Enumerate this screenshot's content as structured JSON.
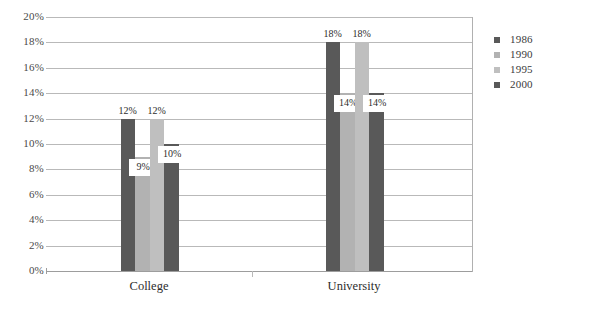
{
  "chart_data": {
    "type": "bar",
    "title": "",
    "subtitle": "",
    "xlabel": "",
    "ylabel": "",
    "categories": [
      "College",
      "University"
    ],
    "series": [
      {
        "name": "1986",
        "values": [
          12,
          18
        ],
        "color": "#595959"
      },
      {
        "name": "1990",
        "values": [
          9,
          14
        ],
        "color": "#b2b2b2"
      },
      {
        "name": "1995",
        "values": [
          12,
          18
        ],
        "color": "#bfbfbf"
      },
      {
        "name": "2000",
        "values": [
          10,
          14
        ],
        "color": "#595959"
      }
    ],
    "value_labels": [
      [
        "12%",
        "9%",
        "12%",
        "10%"
      ],
      [
        "18%",
        "14%",
        "18%",
        "14%"
      ]
    ],
    "ylim": [
      0,
      20
    ],
    "ytick_step": 2,
    "ytick_labels": [
      "20%",
      "18%",
      "16%",
      "14%",
      "12%",
      "10%",
      "8%",
      "6%",
      "4%",
      "2%",
      "0%"
    ],
    "ytick_values": [
      20,
      18,
      16,
      14,
      12,
      10,
      8,
      6,
      4,
      2,
      0
    ],
    "grid": true,
    "legend_position": "right",
    "value_format": "percent"
  },
  "legend": {
    "entries": [
      {
        "label": "1986",
        "color": "#595959"
      },
      {
        "label": "1990",
        "color": "#b2b2b2"
      },
      {
        "label": "1995",
        "color": "#bfbfbf"
      },
      {
        "label": "2000",
        "color": "#595959"
      }
    ]
  },
  "colors": {
    "grid": "#b9b9b9",
    "axis": "#9d9d9d",
    "divider": "#b0b0b0",
    "text": "#3a3a3a",
    "background": "#ffffff"
  }
}
